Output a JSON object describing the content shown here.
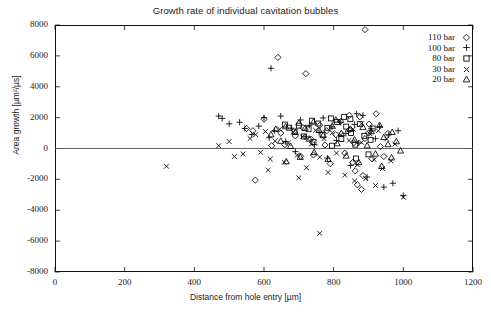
{
  "chart_data": {
    "type": "scatter",
    "title": "Growth rate of individual cavitation bubbles",
    "xlabel": "Distance from hole entry  [µm]",
    "ylabel": "Area growth [µm²/µs]",
    "xlim": [
      0,
      1200
    ],
    "ylim": [
      -8000,
      8000
    ],
    "xticks": [
      0,
      200,
      400,
      600,
      800,
      1000,
      1200
    ],
    "yticks": [
      -8000,
      -6000,
      -4000,
      -2000,
      0,
      2000,
      4000,
      6000,
      8000
    ],
    "grid": false,
    "zero_line": true,
    "legend_position": "top-right",
    "series": [
      {
        "name": "110 bar",
        "marker": "diamond",
        "points": [
          [
            890,
            7700
          ],
          [
            640,
            5900
          ],
          [
            720,
            4850
          ],
          [
            550,
            1300
          ],
          [
            568,
            1150
          ],
          [
            600,
            1900
          ],
          [
            622,
            180
          ],
          [
            648,
            1000
          ],
          [
            660,
            250
          ],
          [
            690,
            820
          ],
          [
            712,
            1350
          ],
          [
            735,
            600
          ],
          [
            742,
            -420
          ],
          [
            760,
            1500
          ],
          [
            775,
            230
          ],
          [
            790,
            -980
          ],
          [
            806,
            900
          ],
          [
            820,
            1750
          ],
          [
            832,
            -300
          ],
          [
            845,
            1200
          ],
          [
            858,
            380
          ],
          [
            862,
            -1450
          ],
          [
            875,
            2050
          ],
          [
            884,
            -1750
          ],
          [
            890,
            640
          ],
          [
            902,
            1580
          ],
          [
            910,
            -660
          ],
          [
            922,
            2250
          ],
          [
            934,
            120
          ],
          [
            944,
            -520
          ],
          [
            956,
            980
          ],
          [
            575,
            -2050
          ],
          [
            880,
            -2650
          ],
          [
            900,
            1000
          ],
          [
            868,
            -2350
          ],
          [
            845,
            2150
          ],
          [
            705,
            -500
          ],
          [
            780,
            1150
          ],
          [
            855,
            -900
          ]
        ]
      },
      {
        "name": "100 bar",
        "marker": "plus",
        "points": [
          [
            620,
            5200
          ],
          [
            470,
            2100
          ],
          [
            480,
            1950
          ],
          [
            500,
            1600
          ],
          [
            530,
            1700
          ],
          [
            545,
            1300
          ],
          [
            565,
            900
          ],
          [
            585,
            1450
          ],
          [
            600,
            2000
          ],
          [
            615,
            700
          ],
          [
            630,
            1150
          ],
          [
            648,
            2100
          ],
          [
            662,
            450
          ],
          [
            678,
            1320
          ],
          [
            690,
            -200
          ],
          [
            705,
            1850
          ],
          [
            718,
            760
          ],
          [
            730,
            1500
          ],
          [
            745,
            240
          ],
          [
            758,
            1050
          ],
          [
            770,
            1980
          ],
          [
            782,
            -620
          ],
          [
            795,
            1400
          ],
          [
            808,
            520
          ],
          [
            820,
            1700
          ],
          [
            835,
            980
          ],
          [
            848,
            -1100
          ],
          [
            860,
            1560
          ],
          [
            872,
            350
          ],
          [
            884,
            2150
          ],
          [
            896,
            -1850
          ],
          [
            908,
            1280
          ],
          [
            920,
            640
          ],
          [
            932,
            1420
          ],
          [
            944,
            -2500
          ],
          [
            958,
            880
          ],
          [
            970,
            -2250
          ],
          [
            1000,
            -3050
          ],
          [
            985,
            1150
          ],
          [
            866,
            2250
          ]
        ]
      },
      {
        "name": "80 bar",
        "marker": "square",
        "points": [
          [
            660,
            1550
          ],
          [
            672,
            1350
          ],
          [
            688,
            1100
          ],
          [
            700,
            1480
          ],
          [
            715,
            780
          ],
          [
            728,
            1250
          ],
          [
            742,
            420
          ],
          [
            756,
            1620
          ],
          [
            768,
            900
          ],
          [
            782,
            1340
          ],
          [
            795,
            180
          ],
          [
            810,
            1720
          ],
          [
            822,
            620
          ],
          [
            836,
            1420
          ],
          [
            850,
            1000
          ],
          [
            862,
            250
          ],
          [
            875,
            1580
          ],
          [
            888,
            820
          ],
          [
            900,
            -380
          ],
          [
            912,
            1300
          ],
          [
            848,
            1900
          ],
          [
            830,
            2050
          ],
          [
            792,
            1950
          ],
          [
            864,
            -650
          ],
          [
            906,
            560
          ],
          [
            738,
            1800
          ]
        ]
      },
      {
        "name": "30 bar",
        "marker": "cross",
        "points": [
          [
            320,
            -1150
          ],
          [
            760,
            -5500
          ],
          [
            540,
            -350
          ],
          [
            560,
            650
          ],
          [
            576,
            900
          ],
          [
            590,
            -250
          ],
          [
            604,
            1100
          ],
          [
            618,
            -680
          ],
          [
            632,
            480
          ],
          [
            645,
            1250
          ],
          [
            658,
            -900
          ],
          [
            670,
            350
          ],
          [
            684,
            1050
          ],
          [
            696,
            -420
          ],
          [
            710,
            760
          ],
          [
            722,
            -1250
          ],
          [
            736,
            280
          ],
          [
            748,
            1180
          ],
          [
            760,
            -560
          ],
          [
            772,
            640
          ],
          [
            784,
            -1550
          ],
          [
            796,
            1020
          ],
          [
            808,
            -300
          ],
          [
            820,
            880
          ],
          [
            832,
            -1720
          ],
          [
            844,
            520
          ],
          [
            856,
            1250
          ],
          [
            868,
            -1050
          ],
          [
            880,
            400
          ],
          [
            892,
            -1950
          ],
          [
            904,
            960
          ],
          [
            916,
            -720
          ],
          [
            928,
            1150
          ],
          [
            940,
            -1300
          ],
          [
            952,
            620
          ],
          [
            964,
            -800
          ],
          [
            976,
            280
          ],
          [
            1000,
            -3150
          ],
          [
            500,
            450
          ],
          [
            515,
            -520
          ],
          [
            470,
            180
          ],
          [
            612,
            -1400
          ],
          [
            700,
            -1900
          ],
          [
            880,
            1600
          ],
          [
            920,
            -2400
          ],
          [
            860,
            -2100
          ]
        ]
      },
      {
        "name": "20 bar",
        "marker": "triangle",
        "points": [
          [
            620,
            900
          ],
          [
            634,
            1250
          ],
          [
            648,
            480
          ],
          [
            662,
            1420
          ],
          [
            676,
            150
          ],
          [
            690,
            1050
          ],
          [
            704,
            -560
          ],
          [
            718,
            1320
          ],
          [
            730,
            620
          ],
          [
            744,
            -250
          ],
          [
            758,
            1180
          ],
          [
            770,
            850
          ],
          [
            784,
            -700
          ],
          [
            796,
            1450
          ],
          [
            810,
            320
          ],
          [
            822,
            980
          ],
          [
            836,
            -480
          ],
          [
            848,
            1250
          ],
          [
            860,
            560
          ],
          [
            872,
            -900
          ],
          [
            884,
            1380
          ],
          [
            896,
            180
          ],
          [
            908,
            1100
          ],
          [
            920,
            -350
          ],
          [
            932,
            1500
          ],
          [
            944,
            720
          ],
          [
            956,
            260
          ],
          [
            968,
            1050
          ],
          [
            980,
            450
          ],
          [
            992,
            -150
          ],
          [
            966,
            -600
          ],
          [
            938,
            -1150
          ],
          [
            700,
            1650
          ],
          [
            742,
            1720
          ],
          [
            664,
            -850
          ],
          [
            806,
            1850
          ]
        ]
      }
    ]
  },
  "legend": {
    "entries": [
      {
        "label": "110 bar",
        "marker": "diamond"
      },
      {
        "label": "100 bar",
        "marker": "plus"
      },
      {
        "label": "80 bar",
        "marker": "square"
      },
      {
        "label": "30 bar",
        "marker": "cross"
      },
      {
        "label": "20 bar",
        "marker": "triangle"
      }
    ]
  }
}
